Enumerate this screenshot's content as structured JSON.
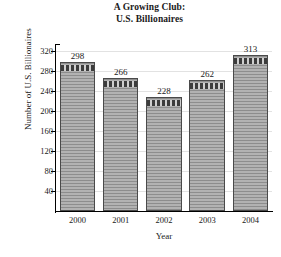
{
  "chart_data": {
    "type": "bar",
    "title": "A Growing Club: U.S. Billionaires",
    "title_lines": [
      "A Growing Club:",
      "U.S. Billionaires"
    ],
    "xlabel": "Year",
    "ylabel": "Number of U.S. Billionaires",
    "categories": [
      "2000",
      "2001",
      "2002",
      "2003",
      "2004"
    ],
    "values": [
      298,
      266,
      228,
      262,
      313
    ],
    "value_labels": [
      "298",
      "266",
      "228",
      "262",
      "313"
    ],
    "ylim": [
      0,
      330
    ],
    "yticks": [
      40,
      80,
      120,
      160,
      200,
      240,
      280,
      320
    ],
    "ytick_labels": [
      "40",
      "80",
      "120",
      "160",
      "200",
      "240",
      "280",
      "320"
    ],
    "grid": true,
    "grid_axis": "y",
    "legend": null,
    "bar_color": "#9a9a9a",
    "bar_edge_color": "#4a4a4a",
    "grid_color": "#e2e2e2",
    "axis_color": "#000000",
    "background_color": "#ffffff"
  }
}
